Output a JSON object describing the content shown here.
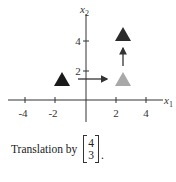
{
  "figure": {
    "axes": {
      "x_label": "x",
      "x_sub": "1",
      "y_label": "x",
      "y_sub": "2",
      "x_ticks": [
        "-4",
        "-2",
        "2",
        "4"
      ],
      "y_ticks": [
        "2",
        "4"
      ]
    },
    "shapes": [
      {
        "name": "original-triangle",
        "center": [
          -1.5,
          1.5
        ],
        "color": "#1a1a1a"
      },
      {
        "name": "intermediate-triangle",
        "center": [
          2.5,
          1.5
        ],
        "color": "#a8a8a8"
      },
      {
        "name": "translated-triangle",
        "center": [
          2.5,
          4.5
        ],
        "color": "#2b2b2b"
      }
    ],
    "arrows": [
      {
        "name": "horizontal-shift-arrow",
        "from": [
          -0.2,
          1.7
        ],
        "to": [
          1.8,
          1.7
        ]
      },
      {
        "name": "vertical-shift-arrow",
        "from": [
          2.5,
          2.6
        ],
        "to": [
          2.5,
          3.9
        ]
      }
    ]
  },
  "caption": {
    "text": "Translation by",
    "vector": [
      "4",
      "3"
    ],
    "suffix": "."
  }
}
